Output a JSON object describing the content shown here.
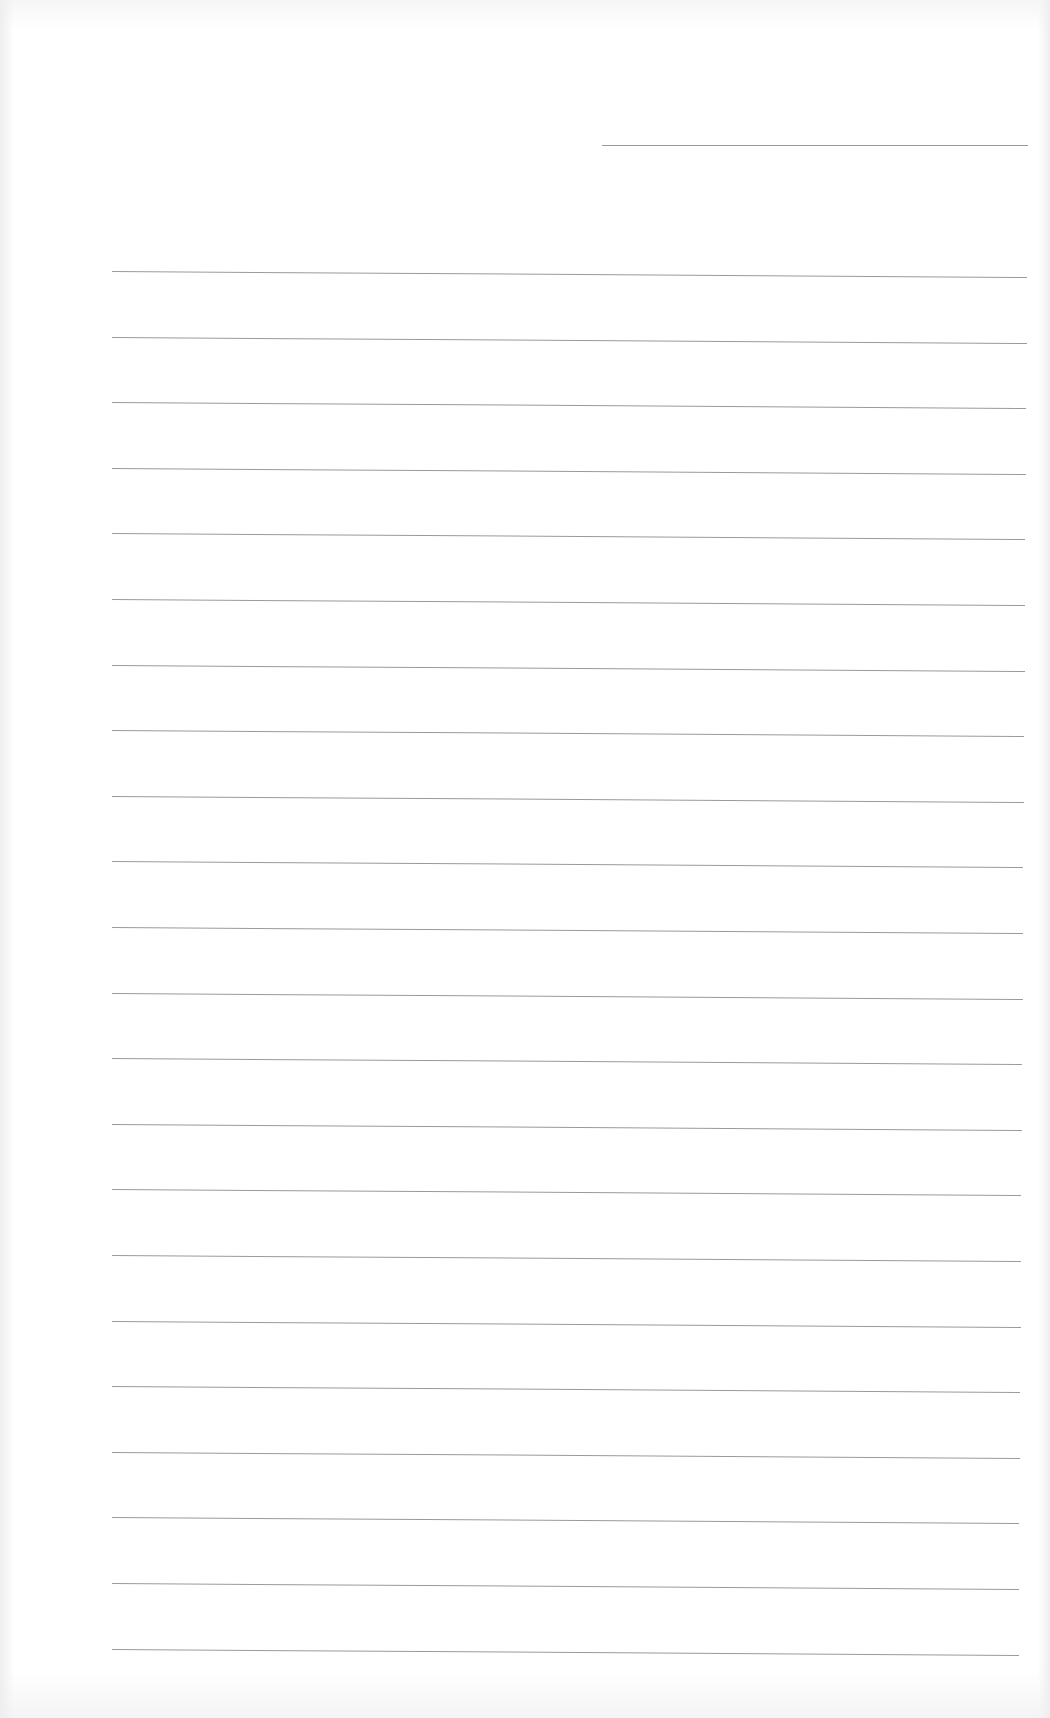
{
  "page": {
    "type": "blank lined notebook page",
    "background_color": "#ffffff",
    "line_color": "#9a9a9a",
    "header_line": {
      "x1": 602,
      "x2": 1028,
      "y": 145,
      "label": ""
    },
    "ruled_lines": {
      "count": 22,
      "x_left": 112,
      "x_right": 1027,
      "first_y_left": 271,
      "first_y_right": 277,
      "spacing": 65.6,
      "tilt_px": 6
    },
    "written_content": []
  }
}
